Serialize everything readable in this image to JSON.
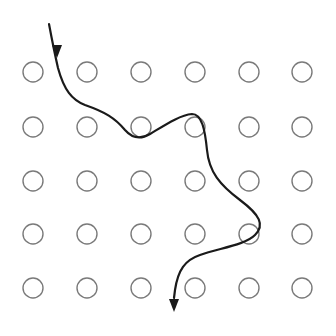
{
  "diagram": {
    "type": "grid-of-circles-with-path",
    "grid": {
      "rows": 5,
      "cols": 6,
      "col_x": [
        33,
        87,
        141,
        195,
        249,
        302
      ],
      "row_y": [
        72,
        127,
        181,
        234,
        288
      ],
      "radius": 10,
      "stroke_color": "#7a7a7a"
    },
    "path": {
      "description": "Wavy arrow entering from top-left, weaving between circles, exiting bottom with arrowhead",
      "stroke_color": "#1a1a1a",
      "d": "M49,24 C52,40 55,55 58,68 C64,90 72,100 85,105 C105,112 115,118 125,130 C132,138 140,140 150,134 C165,125 180,115 192,114 C202,114 205,130 207,150 C209,172 220,185 240,200 C260,215 265,225 255,235 C245,245 220,248 200,255 C185,260 178,270 175,290 L174,298",
      "start_arrow": {
        "x": 57,
        "y": 58,
        "direction": "down"
      },
      "end_arrow": {
        "x": 174,
        "y": 312,
        "direction": "down"
      }
    }
  }
}
